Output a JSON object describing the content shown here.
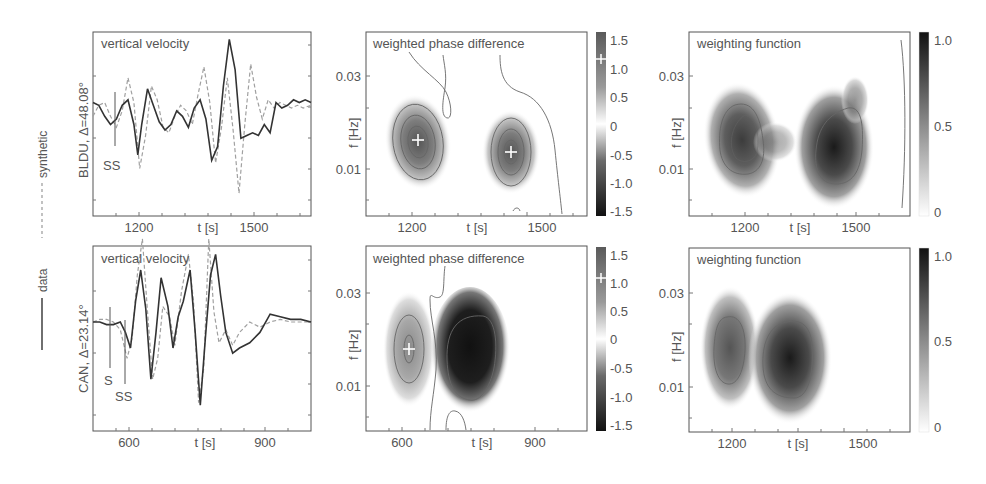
{
  "legend": {
    "synthetic_label": "synthetic",
    "data_label": "data",
    "synthetic_style": "dashed",
    "data_style": "solid"
  },
  "colors": {
    "frame": "#555555",
    "data_line": "#333333",
    "synthetic_line": "#999999",
    "contour": "#666666",
    "text": "#555555"
  },
  "rows": [
    {
      "station_label": "BLDU, Δ=48.08°",
      "velocity": {
        "title": "vertical velocity",
        "xlabel": "t [s]",
        "xticks": [
          {
            "v": 1200,
            "label": "1200"
          },
          {
            "v": 1500,
            "label": "1500"
          }
        ],
        "xrange": [
          1085,
          1645
        ],
        "phase_picks": [
          {
            "label": "SS",
            "t": 1145,
            "label_dx": -2,
            "label_dy": 0
          }
        ]
      },
      "phase": {
        "title": "weighted phase difference",
        "xlabel": "t [s]",
        "ylabel": "f [Hz]",
        "xticks": [
          {
            "v": 1200,
            "label": "1200"
          },
          {
            "v": 1500,
            "label": "1500"
          }
        ],
        "yticks": [
          {
            "v": 0.03,
            "label": "0.03"
          },
          {
            "v": 0.01,
            "label": "0.01"
          }
        ],
        "colorbar_ticks": [
          "1.5",
          "1.0",
          "0.5",
          "0",
          "-0.5",
          "-1.0",
          "-1.5"
        ],
        "colorbar_marker": 1.2
      },
      "weight": {
        "title": "weighting function",
        "xlabel": "t [s]",
        "ylabel": "f [Hz]",
        "xticks": [
          {
            "v": 1200,
            "label": "1200"
          },
          {
            "v": 1500,
            "label": "1500"
          }
        ],
        "yticks": [
          {
            "v": 0.03,
            "label": "0.03"
          },
          {
            "v": 0.01,
            "label": "0.01"
          }
        ],
        "colorbar_ticks": [
          "1.0",
          "0.5",
          "0"
        ]
      }
    },
    {
      "station_label": "CAN, Δ=23.14°",
      "velocity": {
        "title": "vertical velocity",
        "xlabel": "t [s]",
        "xticks": [
          {
            "v": 600,
            "label": "600"
          },
          {
            "v": 900,
            "label": "900"
          }
        ],
        "xrange": [
          470,
          1110
        ],
        "phase_picks": [
          {
            "label": "S",
            "t": 560
          },
          {
            "label": "SS",
            "t": 597
          }
        ]
      },
      "phase": {
        "title": "weighted phase difference",
        "xlabel": "t [s]",
        "ylabel": "f [Hz]",
        "xticks": [
          {
            "v": 600,
            "label": "600"
          },
          {
            "v": 900,
            "label": "900"
          }
        ],
        "yticks": [
          {
            "v": 0.03,
            "label": "0.03"
          },
          {
            "v": 0.01,
            "label": "0.01"
          }
        ],
        "colorbar_ticks": [
          "1.5",
          "1.0",
          "0.5",
          "0",
          "-0.5",
          "-1.0",
          "-1.5"
        ],
        "colorbar_marker": 1.2
      },
      "weight": {
        "title": "weighting function",
        "xlabel": "t [s]",
        "ylabel": "f [Hz]",
        "xticks": [
          {
            "v": 1200,
            "label": "1200"
          },
          {
            "v": 1500,
            "label": "1500"
          }
        ],
        "yticks": [
          {
            "v": 0.03,
            "label": "0.03"
          },
          {
            "v": 0.01,
            "label": "0.01"
          }
        ],
        "colorbar_ticks": [
          "1.0",
          "0.5",
          "0"
        ]
      }
    }
  ],
  "chart_data": [
    {
      "type": "line",
      "title": "vertical velocity",
      "row_label": "BLDU, Δ=48.08°",
      "xlabel": "t [s]",
      "ylabel": "",
      "xlim": [
        1085,
        1645
      ],
      "xticks": [
        1200,
        1500
      ],
      "annotations": [
        {
          "text": "SS",
          "x": 1145
        }
      ],
      "series": [
        {
          "name": "data",
          "style": "solid",
          "x": [
            1085,
            1100,
            1115,
            1130,
            1145,
            1160,
            1175,
            1190,
            1200,
            1210,
            1225,
            1240,
            1255,
            1270,
            1285,
            1300,
            1315,
            1330,
            1345,
            1360,
            1375,
            1390,
            1405,
            1420,
            1435,
            1450,
            1465,
            1480,
            1495,
            1510,
            1525,
            1540,
            1555,
            1570,
            1585,
            1600,
            1615,
            1630,
            1645
          ],
          "y": [
            0.1,
            0.05,
            -0.15,
            -0.3,
            -0.2,
            0.05,
            0.15,
            -0.3,
            -0.85,
            -0.3,
            0.35,
            0.05,
            -0.25,
            -0.4,
            -0.3,
            -0.05,
            -0.15,
            -0.35,
            0.0,
            0.15,
            -0.2,
            -0.95,
            -0.7,
            0.4,
            1.25,
            0.7,
            -0.55,
            -0.5,
            -0.45,
            -0.5,
            -0.3,
            -0.45,
            0.1,
            0.0,
            0.05,
            0.15,
            0.1,
            0.15,
            0.1
          ]
        },
        {
          "name": "synthetic",
          "style": "dashed",
          "x": [
            1085,
            1100,
            1115,
            1130,
            1145,
            1160,
            1175,
            1190,
            1205,
            1220,
            1235,
            1250,
            1265,
            1280,
            1295,
            1310,
            1325,
            1340,
            1355,
            1370,
            1385,
            1400,
            1415,
            1430,
            1445,
            1460,
            1475,
            1490,
            1505,
            1520,
            1535,
            1550,
            1565,
            1580,
            1595,
            1610,
            1625,
            1645
          ],
          "y": [
            -0.15,
            0.05,
            0.1,
            -0.15,
            -0.35,
            -0.05,
            0.55,
            0.1,
            -1.1,
            -0.5,
            0.4,
            0.15,
            -0.35,
            -0.45,
            -0.15,
            0.05,
            -0.05,
            -0.3,
            0.25,
            0.75,
            0.1,
            -1.0,
            -0.35,
            0.55,
            -0.4,
            -1.55,
            -0.3,
            0.8,
            0.2,
            -0.2,
            0.15,
            0.0,
            0.1,
            0.05,
            0.0,
            0.05,
            0.0,
            0.05
          ]
        }
      ]
    },
    {
      "type": "heatmap",
      "title": "weighted phase difference",
      "row_label": "BLDU",
      "xlabel": "t [s]",
      "ylabel": "f [Hz]",
      "xticks": [
        1200,
        1500
      ],
      "yticks": [
        0.01,
        0.03
      ],
      "colorbar": {
        "range": [
          -1.5,
          1.5
        ],
        "ticks": [
          1.5,
          1.0,
          0.5,
          0,
          -0.5,
          -1.0,
          -1.5
        ],
        "marker": 1.2
      },
      "blobs": [
        {
          "t": 1195,
          "f": 0.016,
          "value": 1.2,
          "marker": "+"
        },
        {
          "t": 1435,
          "f": 0.014,
          "value": 1.0,
          "marker": "+"
        }
      ]
    },
    {
      "type": "heatmap",
      "title": "weighting function",
      "row_label": "BLDU",
      "xlabel": "t [s]",
      "ylabel": "f [Hz]",
      "xticks": [
        1200,
        1500
      ],
      "yticks": [
        0.01,
        0.03
      ],
      "colorbar": {
        "range": [
          0,
          1.0
        ],
        "ticks": [
          1.0,
          0.5,
          0
        ]
      },
      "blobs": [
        {
          "t": 1180,
          "f": 0.016,
          "value": 0.75
        },
        {
          "t": 1440,
          "f": 0.014,
          "value": 1.0
        }
      ]
    },
    {
      "type": "line",
      "title": "vertical velocity",
      "row_label": "CAN, Δ=23.14°",
      "xlabel": "t [s]",
      "ylabel": "",
      "xlim": [
        470,
        1110
      ],
      "xticks": [
        600,
        900
      ],
      "annotations": [
        {
          "text": "S",
          "x": 560
        },
        {
          "text": "SS",
          "x": 597
        }
      ],
      "series": [
        {
          "name": "data",
          "style": "solid",
          "x": [
            470,
            490,
            510,
            530,
            550,
            565,
            580,
            595,
            610,
            625,
            640,
            655,
            670,
            690,
            705,
            720,
            735,
            755,
            770,
            785,
            800,
            815,
            830,
            845,
            860,
            880,
            900,
            930,
            960,
            990,
            1020,
            1050,
            1080,
            1110
          ],
          "y": [
            0.0,
            0.0,
            -0.05,
            -0.05,
            0.0,
            -0.2,
            -0.5,
            0.4,
            1.0,
            0.25,
            -1.1,
            -0.2,
            0.85,
            0.3,
            -0.5,
            0.1,
            0.4,
            1.0,
            -0.2,
            -1.6,
            -0.3,
            0.9,
            1.3,
            0.5,
            -0.2,
            -0.6,
            -0.5,
            -0.4,
            -0.2,
            0.15,
            0.1,
            0.05,
            0.05,
            0.0
          ]
        },
        {
          "name": "synthetic",
          "style": "dashed",
          "x": [
            470,
            490,
            510,
            530,
            550,
            570,
            585,
            600,
            615,
            630,
            645,
            660,
            675,
            695,
            710,
            730,
            750,
            765,
            780,
            795,
            810,
            825,
            840,
            860,
            880,
            900,
            930,
            960,
            990,
            1020,
            1050,
            1080,
            1110
          ],
          "y": [
            0.0,
            0.05,
            0.05,
            0.0,
            -0.15,
            -0.7,
            -0.3,
            0.9,
            1.6,
            0.2,
            -1.1,
            -0.7,
            0.3,
            0.1,
            -0.45,
            0.6,
            1.3,
            0.4,
            -1.55,
            -0.9,
            1.6,
            0.2,
            -0.4,
            -0.15,
            -0.45,
            -0.2,
            0.0,
            -0.1,
            0.0,
            0.05,
            0.0,
            0.0,
            0.0
          ]
        }
      ]
    },
    {
      "type": "heatmap",
      "title": "weighted phase difference",
      "row_label": "CAN",
      "xlabel": "t [s]",
      "ylabel": "f [Hz]",
      "xticks": [
        600,
        900
      ],
      "yticks": [
        0.01,
        0.03
      ],
      "colorbar": {
        "range": [
          -1.5,
          1.5
        ],
        "ticks": [
          1.5,
          1.0,
          0.5,
          0,
          -0.5,
          -1.0,
          -1.5
        ],
        "marker": 1.2
      },
      "blobs": [
        {
          "t": 615,
          "f": 0.017,
          "value": 1.0,
          "marker": "+"
        },
        {
          "t": 790,
          "f": 0.016,
          "value": -1.5
        }
      ]
    },
    {
      "type": "heatmap",
      "title": "weighting function",
      "row_label": "CAN",
      "xlabel": "t [s]",
      "ylabel": "f [Hz]",
      "xticks": [
        1200,
        1500
      ],
      "yticks": [
        0.01,
        0.03
      ],
      "colorbar": {
        "range": [
          0,
          1.0
        ],
        "ticks": [
          1.0,
          0.5,
          0
        ]
      },
      "blobs": [
        {
          "t": 1195,
          "f": 0.018,
          "value": 0.6
        },
        {
          "t": 1375,
          "f": 0.016,
          "value": 1.0
        }
      ]
    }
  ]
}
